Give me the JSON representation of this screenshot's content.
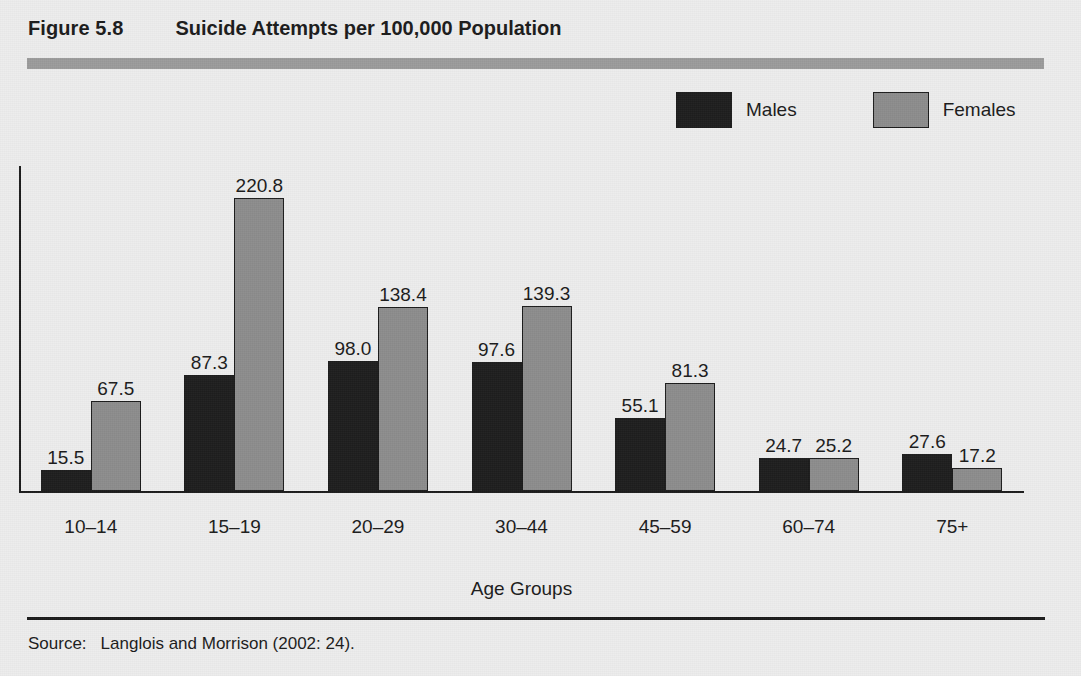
{
  "figure": {
    "number": "Figure 5.8",
    "title": "Suicide Attempts per 100,000 Population"
  },
  "source": {
    "label": "Source:",
    "text": "Langlois and Morrison (2002: 24)."
  },
  "colors": {
    "males": "#1d1d1d",
    "females": "#8c8c8c",
    "background": "#ededed",
    "axis": "#1b1b1b",
    "header_rule": "#9a9a9a"
  },
  "chart_data": {
    "type": "bar",
    "title": "Suicide Attempts per 100,000 Population",
    "xlabel": "Age Groups",
    "ylabel": "",
    "ylim": [
      0,
      245
    ],
    "grid": false,
    "legend_position": "top-right",
    "value_labels": true,
    "categories": [
      "10–14",
      "15–19",
      "20–29",
      "30–44",
      "45–59",
      "60–74",
      "75+"
    ],
    "series": [
      {
        "name": "Males",
        "color": "#1d1d1d",
        "values": [
          15.5,
          87.3,
          98.0,
          97.6,
          55.1,
          24.7,
          27.6
        ],
        "labels": [
          "15.5",
          "87.3",
          "98.0",
          "97.6",
          "55.1",
          "24.7",
          "27.6"
        ]
      },
      {
        "name": "Females",
        "color": "#8c8c8c",
        "values": [
          67.5,
          220.8,
          138.4,
          139.3,
          81.3,
          25.2,
          17.2
        ],
        "labels": [
          "67.5",
          "220.8",
          "138.4",
          "139.3",
          "81.3",
          "25.2",
          "17.2"
        ]
      }
    ]
  }
}
